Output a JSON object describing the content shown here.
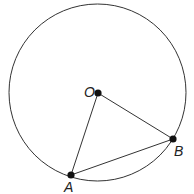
{
  "diagram": {
    "type": "geometry",
    "circle": {
      "cx": 97.5,
      "cy": 92.5,
      "r": 88.5,
      "stroke": "#333333"
    },
    "points": [
      {
        "id": "O",
        "label": "O",
        "x": 98,
        "y": 93,
        "label_x": 84,
        "label_y": 92
      },
      {
        "id": "A",
        "label": "A",
        "x": 71,
        "y": 175,
        "label_x": 63,
        "label_y": 191
      },
      {
        "id": "B",
        "label": "B",
        "x": 173,
        "y": 139,
        "label_x": 174,
        "label_y": 155
      }
    ],
    "segments": [
      {
        "from": "O",
        "to": "A"
      },
      {
        "from": "O",
        "to": "B"
      },
      {
        "from": "A",
        "to": "B"
      }
    ],
    "point_color": "#111111",
    "line_color": "#333333"
  }
}
